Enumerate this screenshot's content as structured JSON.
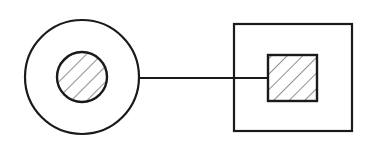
{
  "diagram": {
    "background": "#ffffff",
    "stroke_color": "#1a1a1a",
    "hatch_color": "#444444",
    "elements": [
      {
        "name": "outer-circle",
        "shape": "circle",
        "cx": 82,
        "cy": 77,
        "r": 57
      },
      {
        "name": "inner-hatched-circle",
        "shape": "circle",
        "cx": 82,
        "cy": 77,
        "r": 25,
        "fill": "hatch"
      },
      {
        "name": "connector-line",
        "shape": "line",
        "x1": 139,
        "y1": 78,
        "x2": 268,
        "y2": 78
      },
      {
        "name": "outer-square",
        "shape": "rect",
        "x": 234,
        "y": 24,
        "w": 118,
        "h": 107
      },
      {
        "name": "inner-hatched-square",
        "shape": "rect",
        "x": 268,
        "y": 55,
        "w": 49,
        "h": 46,
        "fill": "hatch"
      }
    ]
  }
}
